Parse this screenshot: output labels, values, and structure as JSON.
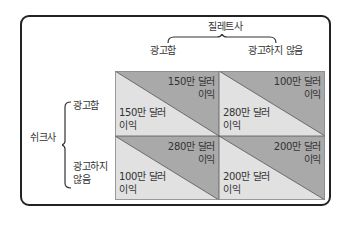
{
  "diagram": {
    "column_player": "질레트사",
    "columns": [
      "광고함",
      "광고하지 않음"
    ],
    "row_player": "쉬크사",
    "rows": [
      "광고함",
      "광고하지 않음"
    ],
    "rows_display": [
      [
        "광고함"
      ],
      [
        "광고하지",
        "않음"
      ]
    ],
    "colors": {
      "dark": "#a9a9a9",
      "light": "#e1e1e1",
      "border": "#222222"
    },
    "cells": [
      {
        "row": 0,
        "col": 0,
        "column_player_payoff": [
          "150만 달러",
          "이익"
        ],
        "row_player_payoff": [
          "150만 달러",
          "이익"
        ]
      },
      {
        "row": 0,
        "col": 1,
        "column_player_payoff": [
          "100만 달러",
          "이익"
        ],
        "row_player_payoff": [
          "280만 달러",
          "이익"
        ]
      },
      {
        "row": 1,
        "col": 0,
        "column_player_payoff": [
          "280만 달러",
          "이익"
        ],
        "row_player_payoff": [
          "100만 달러",
          "이익"
        ]
      },
      {
        "row": 1,
        "col": 1,
        "column_player_payoff": [
          "200만 달러",
          "이익"
        ],
        "row_player_payoff": [
          "200만 달러",
          "이익"
        ]
      }
    ]
  }
}
